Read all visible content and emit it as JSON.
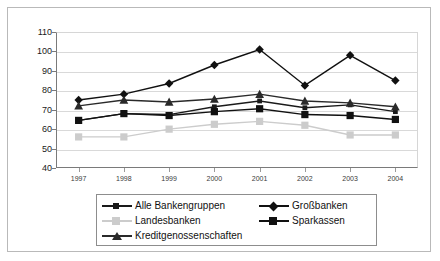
{
  "chart_data": {
    "type": "line",
    "title": "",
    "subtitle": "",
    "xlabel": "",
    "ylabel": "",
    "categories": [
      "1997",
      "1998",
      "1999",
      "2000",
      "2001",
      "2002",
      "2003",
      "2004"
    ],
    "x": [
      1997,
      1998,
      1999,
      2000,
      2001,
      2002,
      2003,
      2004
    ],
    "ylim": [
      40,
      110
    ],
    "yticks": [
      40,
      50,
      60,
      70,
      80,
      90,
      100,
      110
    ],
    "grid": true,
    "legend_position": "bottom",
    "series": [
      {
        "name": "Alle Bankengruppen",
        "marker": "small-square",
        "color": "#1a1a1a",
        "values": [
          64.5,
          68.0,
          67.5,
          71.5,
          74.5,
          71.0,
          72.5,
          69.0
        ]
      },
      {
        "name": "Großbanken",
        "marker": "diamond",
        "color": "#111111",
        "values": [
          75.0,
          78.0,
          83.5,
          93.0,
          101.0,
          82.5,
          98.0,
          85.0
        ]
      },
      {
        "name": "Landesbanken",
        "marker": "square",
        "color": "#cccccc",
        "values": [
          56.0,
          56.0,
          60.0,
          62.5,
          64.0,
          62.0,
          57.0,
          57.0
        ]
      },
      {
        "name": "Sparkassen",
        "marker": "square",
        "color": "#111111",
        "values": [
          64.5,
          68.0,
          67.0,
          69.0,
          70.5,
          67.5,
          67.0,
          65.0
        ]
      },
      {
        "name": "Kreditgenossenschaften",
        "marker": "triangle",
        "color": "#2a2a2a",
        "values": [
          72.0,
          75.0,
          74.0,
          75.5,
          78.0,
          74.5,
          73.5,
          71.5
        ]
      }
    ],
    "ytick_labels": [
      "110",
      "100",
      "90",
      "80",
      "70",
      "60",
      "50",
      "40"
    ]
  },
  "legend": {
    "rows": [
      [
        {
          "label": "Alle Bankengruppen",
          "marker": "small-square",
          "color": "#1a1a1a"
        },
        {
          "label": "Großbanken",
          "marker": "diamond",
          "color": "#111111"
        }
      ],
      [
        {
          "label": "Landesbanken",
          "marker": "square",
          "color": "#cccccc"
        },
        {
          "label": "Sparkassen",
          "marker": "square",
          "color": "#111111"
        }
      ],
      [
        {
          "label": "Kreditgenossenschaften",
          "marker": "triangle",
          "color": "#2a2a2a"
        }
      ]
    ]
  },
  "colors": {
    "background": "#ffffff",
    "frame": "#b9b9b9",
    "axis": "#7a7a7a",
    "grid": "#d9d9d9",
    "legend_border": "#8d8d8d",
    "text": "#1a1a1a"
  }
}
